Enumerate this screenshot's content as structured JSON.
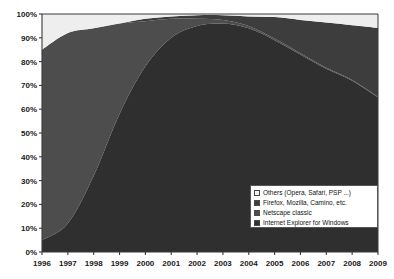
{
  "chart_data": {
    "type": "area",
    "stacked": true,
    "title": "",
    "xlabel": "",
    "ylabel": "",
    "x": [
      1996,
      1997,
      1998,
      1999,
      2000,
      2001,
      2002,
      2003,
      2004,
      2005,
      2006,
      2007,
      2008,
      2009
    ],
    "categories": [
      "1996",
      "1997",
      "1998",
      "1999",
      "2000",
      "2001",
      "2002",
      "2003",
      "2004",
      "2005",
      "2006",
      "2007",
      "2008",
      "2009"
    ],
    "xlim": [
      1996,
      2009
    ],
    "ylim": [
      0,
      100
    ],
    "ytick_labels": [
      "0%",
      "10%",
      "20%",
      "30%",
      "40%",
      "50%",
      "60%",
      "70%",
      "80%",
      "90%",
      "100%"
    ],
    "ytick_values": [
      0,
      10,
      20,
      30,
      40,
      50,
      60,
      70,
      80,
      90,
      100
    ],
    "grid": false,
    "legend_position": "bottom-right",
    "series": [
      {
        "name": "Internet Explorer for Windows",
        "color": "#2f2f2f",
        "values": [
          5,
          12,
          32,
          58,
          78,
          90,
          95,
          96,
          94,
          89,
          83,
          77,
          72,
          65
        ]
      },
      {
        "name": "Netscape classic",
        "color": "#4d4d4d",
        "values": [
          80,
          80,
          62,
          38,
          19,
          8,
          3,
          1.5,
          1,
          0.7,
          0.5,
          0.4,
          0.3,
          0.2
        ]
      },
      {
        "name": "Firefox, Mozilla, Camino, etc.",
        "color": "#3d3d3d",
        "values": [
          0,
          0,
          0,
          0,
          1,
          1,
          1.5,
          2,
          4,
          9,
          14,
          19,
          23,
          29
        ]
      },
      {
        "name": "Others (Opera, Safari, PSP ...)",
        "color": "#eeeeee",
        "values": [
          15,
          8,
          6,
          4,
          2,
          1,
          0.5,
          0.5,
          1,
          1.3,
          2.5,
          3.6,
          4.7,
          5.8
        ]
      }
    ]
  },
  "legend": {
    "items": [
      {
        "label": "Others (Opera, Safari, PSP ...)",
        "color": "#f2f2f2"
      },
      {
        "label": "Firefox, Mozilla, Camino, etc.",
        "color": "#3d3d3d"
      },
      {
        "label": "Netscape classic",
        "color": "#4d4d4d"
      },
      {
        "label": "Internet Explorer for Windows",
        "color": "#2f2f2f"
      }
    ]
  },
  "axes": {
    "plot_bg": "#f2f2f2",
    "axis_color": "#3a3a3a"
  }
}
